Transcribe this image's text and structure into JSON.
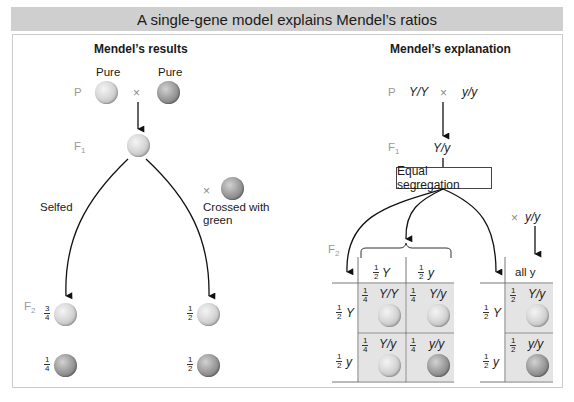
{
  "title": "A single-gene model explains Mendel’s ratios",
  "left_panel": {
    "heading": "Mendel’s results",
    "pure_left": "Pure",
    "pure_right": "Pure",
    "gen_p": "P",
    "gen_f": "F",
    "sub_1": "1",
    "sub_2": "2",
    "times": "×",
    "selfed": "Selfed",
    "crossed_line1": "Crossed with",
    "crossed_line2": "green",
    "f2_selfed": [
      {
        "num": "3",
        "den": "4",
        "color": "yellow"
      },
      {
        "num": "1",
        "den": "4",
        "color": "green"
      }
    ],
    "f2_crossed": [
      {
        "num": "1",
        "den": "2",
        "color": "yellow"
      },
      {
        "num": "1",
        "den": "2",
        "color": "green"
      }
    ]
  },
  "right_panel": {
    "heading": "Mendel’s explanation",
    "p_left": "Y/Y",
    "p_right": "y/y",
    "f1_genotype": "Y/y",
    "segregation_box": "Equal segregation",
    "tester": "y/y",
    "punnett": {
      "col_headers": [
        {
          "num": "1",
          "den": "2",
          "allele": "Y"
        },
        {
          "num": "1",
          "den": "2",
          "allele": "y"
        }
      ],
      "row_headers": [
        {
          "num": "1",
          "den": "2",
          "allele": "Y"
        },
        {
          "num": "1",
          "den": "2",
          "allele": "y"
        }
      ],
      "cells": [
        {
          "num": "1",
          "den": "4",
          "genotype": "Y/Y",
          "color": "yellow"
        },
        {
          "num": "1",
          "den": "4",
          "genotype": "Y/y",
          "color": "yellow"
        },
        {
          "num": "1",
          "den": "4",
          "genotype": "Y/y",
          "color": "yellow"
        },
        {
          "num": "1",
          "den": "4",
          "genotype": "y/y",
          "color": "green"
        }
      ]
    },
    "testcross": {
      "col_header": "all y",
      "row_headers": [
        {
          "num": "1",
          "den": "2",
          "allele": "Y"
        },
        {
          "num": "1",
          "den": "2",
          "allele": "y"
        }
      ],
      "cells": [
        {
          "num": "1",
          "den": "2",
          "genotype": "Y/y",
          "color": "yellow"
        },
        {
          "num": "1",
          "den": "2",
          "genotype": "y/y",
          "color": "green"
        }
      ]
    }
  },
  "colors": {
    "title_bg": "#cfcfcf",
    "cell_bg": "#e4e4e4",
    "frame_border": "#cccccc"
  }
}
